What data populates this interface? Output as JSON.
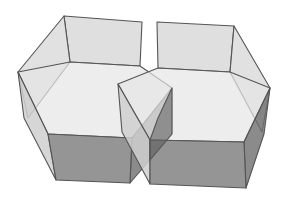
{
  "diagram": {
    "type": "3d-solid",
    "colors": {
      "background": "#ffffff",
      "top_face": "#e6e6e6",
      "inner_wall": "#dcdcdc",
      "side_light": "#cfcfcf",
      "front_face": "#8a8a8a",
      "side_dark": "#6e6e6e",
      "overlap_dark": "#5e5e5e",
      "edge": "#555555"
    },
    "prisms": [
      {
        "name": "left-prism",
        "back_wall": [
          [
            64,
            16
          ],
          [
            142,
            22
          ],
          [
            140,
            66
          ],
          [
            70,
            62
          ]
        ],
        "left_back_wall": [
          [
            18,
            72
          ],
          [
            64,
            16
          ],
          [
            70,
            62
          ],
          [
            28,
            118
          ]
        ],
        "top_hex": [
          [
            18,
            72
          ],
          [
            70,
            62
          ],
          [
            140,
            66
          ],
          [
            172,
            88
          ],
          [
            132,
            138
          ],
          [
            48,
            134
          ]
        ],
        "left_side": [
          [
            18,
            72
          ],
          [
            48,
            134
          ],
          [
            56,
            180
          ],
          [
            24,
            118
          ]
        ],
        "front_face": [
          [
            48,
            134
          ],
          [
            132,
            138
          ],
          [
            130,
            183
          ],
          [
            56,
            180
          ]
        ],
        "right_side": [
          [
            132,
            138
          ],
          [
            172,
            88
          ],
          [
            172,
            134
          ],
          [
            130,
            183
          ]
        ]
      },
      {
        "name": "right-prism",
        "back_wall": [
          [
            157,
            22
          ],
          [
            234,
            26
          ],
          [
            230,
            72
          ],
          [
            158,
            68
          ]
        ],
        "right_back_wall": [
          [
            234,
            26
          ],
          [
            270,
            88
          ],
          [
            262,
            132
          ],
          [
            230,
            72
          ]
        ],
        "top_hex": [
          [
            118,
            84
          ],
          [
            158,
            68
          ],
          [
            230,
            72
          ],
          [
            270,
            88
          ],
          [
            244,
            142
          ],
          [
            150,
            140
          ]
        ],
        "left_side": [
          [
            118,
            84
          ],
          [
            150,
            140
          ],
          [
            150,
            184
          ],
          [
            122,
            132
          ]
        ],
        "front_face": [
          [
            150,
            140
          ],
          [
            244,
            142
          ],
          [
            246,
            188
          ],
          [
            150,
            184
          ]
        ],
        "right_side": [
          [
            244,
            142
          ],
          [
            270,
            88
          ],
          [
            264,
            134
          ],
          [
            246,
            188
          ]
        ]
      }
    ]
  }
}
